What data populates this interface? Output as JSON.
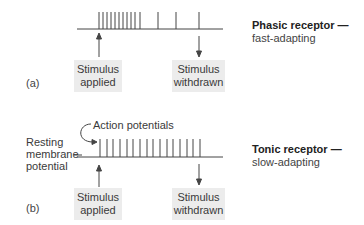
{
  "panels": [
    {
      "id": "a",
      "panel_label": "(a)",
      "title": "Phasic receptor —",
      "subtitle": "fast-adapting",
      "stimulus_applied": {
        "line1": "Stimulus",
        "line2": "applied"
      },
      "stimulus_withdrawn": {
        "line1": "Stimulus",
        "line2": "withdrawn"
      },
      "spike_x": [
        99,
        103,
        107,
        111,
        115,
        119,
        123,
        127,
        131,
        135,
        140,
        158,
        176,
        199
      ],
      "baseline_y": 29,
      "spike_top_y": 12
    },
    {
      "id": "b",
      "panel_label": "(b)",
      "title": "Tonic receptor —",
      "subtitle": "slow-adapting",
      "annotation_action_potentials": "Action potentials",
      "resting_label": {
        "line1": "Resting",
        "line2": "membrane",
        "line3": "potential"
      },
      "stimulus_applied": {
        "line1": "Stimulus",
        "line2": "applied"
      },
      "stimulus_withdrawn": {
        "line1": "Stimulus",
        "line2": "withdrawn"
      },
      "spike_x": [
        100,
        107,
        113,
        120,
        127,
        133,
        140,
        147,
        153,
        160,
        167,
        173,
        180,
        187,
        193,
        200
      ],
      "baseline_y": 157,
      "spike_top_y": 139
    }
  ],
  "colors": {
    "line": "#444444",
    "box_fill": "#ececec",
    "text": "#333333"
  }
}
